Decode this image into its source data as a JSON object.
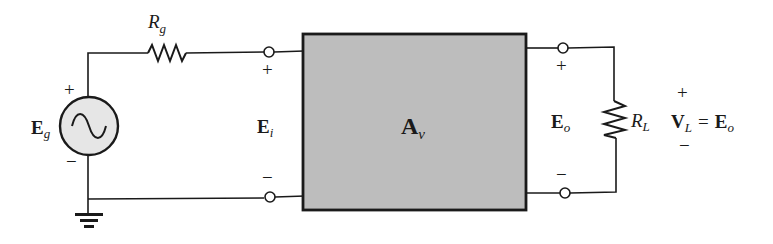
{
  "diagram": {
    "type": "circuit-schematic",
    "colors": {
      "line": "#1a1a1a",
      "box_fill": "#bdbdbd",
      "source_fill": "#e6e6e6",
      "background": "#ffffff"
    },
    "source": {
      "label_main": "E",
      "label_sub": "g",
      "plus": "+",
      "minus": "−",
      "symbol": "ac-sine"
    },
    "source_resistor": {
      "label_main": "R",
      "label_sub": "g"
    },
    "input": {
      "label_main": "E",
      "label_sub": "i",
      "plus": "+",
      "minus": "−"
    },
    "amplifier": {
      "label_main": "A",
      "label_sub": "v"
    },
    "output": {
      "label_main": "E",
      "label_sub": "o",
      "plus": "+",
      "minus": "−"
    },
    "load_resistor": {
      "label_main": "R",
      "label_sub": "L"
    },
    "load_voltage": {
      "plus": "+",
      "minus": "−",
      "lhs_main": "V",
      "lhs_sub": "L",
      "equals": "=",
      "rhs_main": "E",
      "rhs_sub": "o"
    },
    "ground": {
      "symbol": "ground"
    }
  }
}
